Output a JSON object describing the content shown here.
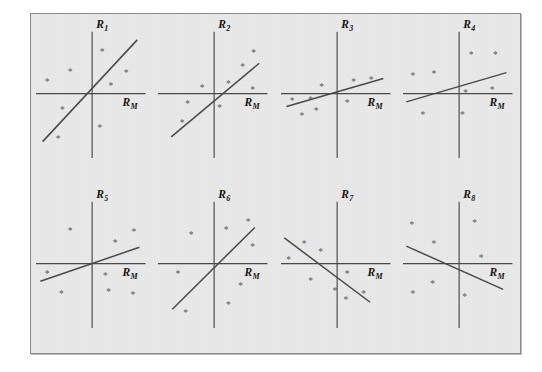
{
  "figure": {
    "background_color": "#e9e9e9",
    "page_color": "#ffffff",
    "border_color": "#8a8a8a",
    "line_color": "#4a4a4a",
    "marker_color": "#5a5a5a",
    "marker_glyph": "*",
    "rows": 2,
    "columns": 4
  },
  "chart_data": {
    "type": "scatter",
    "title": "",
    "subtitle": "",
    "grid": false,
    "legend": null,
    "shared_xlabel": "R_M",
    "xlabel": "R_M",
    "panel_count": 8,
    "axis_note": "Each panel shows an unlabeled scatter of asterisk markers with a fitted straight characteristic line through a centered origin cross; axes carry no tick marks or numeric tick labels.",
    "panels": [
      {
        "id": "panel-1",
        "ylabel": "R",
        "ysub": "1",
        "xlabel": "R",
        "xsub": "M",
        "slope_sign": "positive",
        "slope_description": "steep positive",
        "points": [
          {
            "x": 0.18,
            "y": 0.72
          },
          {
            "x": -0.4,
            "y": 0.38
          },
          {
            "x": -0.82,
            "y": 0.2
          },
          {
            "x": 0.62,
            "y": 0.36
          },
          {
            "x": 0.34,
            "y": 0.14
          },
          {
            "x": -0.54,
            "y": -0.28
          },
          {
            "x": 0.14,
            "y": -0.58
          },
          {
            "x": -0.62,
            "y": -0.78
          }
        ],
        "line": {
          "x1": -0.9,
          "y1": -0.82,
          "x2": 0.82,
          "y2": 0.92
        }
      },
      {
        "id": "panel-2",
        "ylabel": "R",
        "ysub": "2",
        "xlabel": "R",
        "xsub": "M",
        "slope_sign": "positive",
        "slope_description": "moderate positive",
        "points": [
          {
            "x": 0.72,
            "y": 0.7
          },
          {
            "x": 0.52,
            "y": 0.46
          },
          {
            "x": 0.26,
            "y": 0.17
          },
          {
            "x": 0.7,
            "y": 0.07
          },
          {
            "x": -0.22,
            "y": 0.1
          },
          {
            "x": -0.48,
            "y": -0.18
          },
          {
            "x": 0.1,
            "y": -0.25
          },
          {
            "x": -0.58,
            "y": -0.5
          }
        ],
        "line": {
          "x1": -0.78,
          "y1": -0.74,
          "x2": 0.82,
          "y2": 0.52
        }
      },
      {
        "id": "panel-3",
        "ylabel": "R",
        "ysub": "3",
        "xlabel": "R",
        "xsub": "M",
        "slope_sign": "positive",
        "slope_description": "shallow positive",
        "points": [
          {
            "x": 0.3,
            "y": 0.2
          },
          {
            "x": 0.62,
            "y": 0.24
          },
          {
            "x": -0.28,
            "y": 0.12
          },
          {
            "x": -0.48,
            "y": -0.1
          },
          {
            "x": -0.82,
            "y": -0.12
          },
          {
            "x": 0.18,
            "y": -0.16
          },
          {
            "x": -0.38,
            "y": -0.3
          },
          {
            "x": -0.64,
            "y": -0.38
          }
        ],
        "line": {
          "x1": -0.92,
          "y1": -0.22,
          "x2": 0.84,
          "y2": 0.26
        }
      },
      {
        "id": "panel-4",
        "ylabel": "R",
        "ysub": "4",
        "xlabel": "R",
        "xsub": "M",
        "slope_sign": "positive",
        "slope_description": "shallow positive",
        "points": [
          {
            "x": 0.22,
            "y": 0.66
          },
          {
            "x": 0.66,
            "y": 0.66
          },
          {
            "x": -0.46,
            "y": 0.34
          },
          {
            "x": -0.84,
            "y": 0.3
          },
          {
            "x": 0.6,
            "y": 0.06
          },
          {
            "x": 0.12,
            "y": 0.02
          },
          {
            "x": -0.66,
            "y": -0.36
          },
          {
            "x": 0.06,
            "y": -0.36
          }
        ],
        "line": {
          "x1": -0.96,
          "y1": -0.14,
          "x2": 0.86,
          "y2": 0.36
        }
      },
      {
        "id": "panel-5",
        "ylabel": "R",
        "ysub": "5",
        "xlabel": "R",
        "xsub": "M",
        "slope_sign": "positive",
        "slope_description": "shallow positive",
        "points": [
          {
            "x": -0.4,
            "y": 0.56
          },
          {
            "x": 0.76,
            "y": 0.54
          },
          {
            "x": 0.42,
            "y": 0.36
          },
          {
            "x": -0.82,
            "y": -0.18
          },
          {
            "x": 0.24,
            "y": -0.2
          },
          {
            "x": -0.56,
            "y": -0.52
          },
          {
            "x": 0.3,
            "y": -0.48
          },
          {
            "x": 0.74,
            "y": -0.54
          }
        ],
        "line": {
          "x1": -0.94,
          "y1": -0.3,
          "x2": 0.86,
          "y2": 0.28
        }
      },
      {
        "id": "panel-6",
        "ylabel": "R",
        "ysub": "6",
        "xlabel": "R",
        "xsub": "M",
        "slope_sign": "positive",
        "slope_description": "steep positive",
        "points": [
          {
            "x": 0.62,
            "y": 0.72
          },
          {
            "x": 0.22,
            "y": 0.58
          },
          {
            "x": -0.42,
            "y": 0.5
          },
          {
            "x": 0.7,
            "y": 0.28
          },
          {
            "x": -0.66,
            "y": -0.18
          },
          {
            "x": 0.48,
            "y": -0.38
          },
          {
            "x": 0.26,
            "y": -0.7
          },
          {
            "x": -0.52,
            "y": -0.84
          }
        ],
        "line": {
          "x1": -0.76,
          "y1": -0.78,
          "x2": 0.74,
          "y2": 0.62
        }
      },
      {
        "id": "panel-7",
        "ylabel": "R",
        "ysub": "7",
        "xlabel": "R",
        "xsub": "M",
        "slope_sign": "negative",
        "slope_description": "moderate negative",
        "points": [
          {
            "x": -0.6,
            "y": 0.34
          },
          {
            "x": -0.3,
            "y": 0.2
          },
          {
            "x": -0.88,
            "y": 0.06
          },
          {
            "x": 0.18,
            "y": -0.18
          },
          {
            "x": -0.48,
            "y": -0.3
          },
          {
            "x": -0.04,
            "y": -0.46
          },
          {
            "x": 0.48,
            "y": -0.52
          },
          {
            "x": 0.16,
            "y": -0.62
          }
        ],
        "line": {
          "x1": -0.96,
          "y1": 0.44,
          "x2": 0.6,
          "y2": -0.66
        }
      },
      {
        "id": "panel-8",
        "ylabel": "R",
        "ysub": "8",
        "xlabel": "R",
        "xsub": "M",
        "slope_sign": "negative",
        "slope_description": "shallow negative",
        "points": [
          {
            "x": 0.28,
            "y": 0.7
          },
          {
            "x": -0.86,
            "y": 0.66
          },
          {
            "x": -0.46,
            "y": 0.34
          },
          {
            "x": 0.4,
            "y": 0.1
          },
          {
            "x": -0.48,
            "y": -0.34
          },
          {
            "x": -0.84,
            "y": -0.52
          },
          {
            "x": 0.1,
            "y": -0.56
          }
        ],
        "line": {
          "x1": -0.96,
          "y1": 0.3,
          "x2": 0.8,
          "y2": -0.44
        }
      }
    ]
  }
}
